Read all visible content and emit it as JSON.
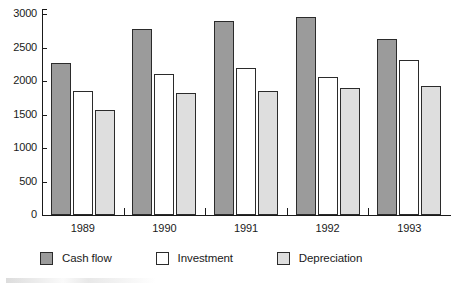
{
  "chart_data": {
    "type": "bar",
    "title": "",
    "subtitle": "",
    "xlabel": "",
    "ylabel": "",
    "categories": [
      "1989",
      "1990",
      "1991",
      "1992",
      "1993"
    ],
    "series": [
      {
        "name": "Cash flow",
        "color": "#9b9b9b",
        "values": [
          2270,
          2780,
          2900,
          2960,
          2630
        ]
      },
      {
        "name": "Investment",
        "color": "#ffffff",
        "values": [
          1845,
          2105,
          2200,
          2060,
          2320
        ]
      },
      {
        "name": "Depreciation",
        "color": "#dedede",
        "values": [
          1560,
          1825,
          1855,
          1890,
          1925
        ]
      }
    ],
    "ylim": [
      0,
      3000
    ],
    "yticks": [
      0,
      500,
      1000,
      1500,
      2000,
      2500,
      3000
    ],
    "ytick_labels": [
      "0",
      "500",
      "1000",
      "1500",
      "2000",
      "2500",
      "3000"
    ],
    "grid": false,
    "legend_position": "bottom",
    "bar_outline_color": "#2b2b2b",
    "axis_color": "#1a1a1a",
    "background": "#ffffff"
  }
}
